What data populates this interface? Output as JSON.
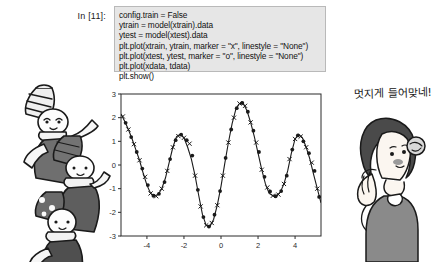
{
  "notebook": {
    "prompt_label": "In [11]:",
    "code_lines": [
      "config.train = False",
      "ytrain = model(xtrain).data",
      "ytest = model(xtest).data",
      "plt.plot(xtrain, ytrain, marker = \"x\", linestyle = \"None\")",
      "plt.plot(xtest, ytest, marker = \"o\", linestyle = \"None\")",
      "plt.plot(xdata, tdata)",
      "plt.show()"
    ],
    "cell_background": "#e6e6e6",
    "cell_border": "#b9b9b9"
  },
  "annotation": {
    "korean_text": "멋지게 들어맞네!"
  },
  "illustrations": {
    "left_group_label": "three-cartoon-kids-with-striped-hats-and-scarves",
    "right_label": "woman-with-short-hair-hands-raised"
  },
  "chart_data": {
    "type": "line",
    "title": "",
    "xlabel": "",
    "ylabel": "",
    "xlim": [
      -5.4,
      5.4
    ],
    "ylim": [
      -3,
      3
    ],
    "xticks": [
      -4,
      -2,
      0,
      2,
      4
    ],
    "yticks": [
      3,
      2,
      1,
      0,
      -1,
      -2,
      -3
    ],
    "grid": false,
    "legend": "none",
    "series": [
      {
        "name": "tdata (true curve)",
        "marker": "none",
        "linestyle": "-",
        "color": "#1a1a1a",
        "x": [
          -5.4,
          -5.2,
          -5.0,
          -4.8,
          -4.6,
          -4.4,
          -4.2,
          -4.0,
          -3.8,
          -3.6,
          -3.4,
          -3.2,
          -3.0,
          -2.8,
          -2.6,
          -2.4,
          -2.2,
          -2.0,
          -1.8,
          -1.6,
          -1.4,
          -1.2,
          -1.0,
          -0.8,
          -0.6,
          -0.4,
          -0.2,
          0.0,
          0.2,
          0.4,
          0.6,
          0.8,
          1.0,
          1.2,
          1.4,
          1.6,
          1.8,
          2.0,
          2.2,
          2.4,
          2.6,
          2.8,
          3.0,
          3.2,
          3.4,
          3.6,
          3.8,
          4.0,
          4.2,
          4.4,
          4.6,
          4.8,
          5.0,
          5.2,
          5.4
        ],
        "y": [
          2.15,
          1.85,
          1.5,
          1.1,
          0.65,
          0.2,
          -0.35,
          -0.85,
          -1.2,
          -1.3,
          -1.25,
          -1.0,
          -0.55,
          0.1,
          0.75,
          1.2,
          1.3,
          1.15,
          0.75,
          0.25,
          -0.45,
          -1.3,
          -2.1,
          -2.55,
          -2.6,
          -2.3,
          -1.7,
          -0.9,
          0.05,
          0.95,
          1.75,
          2.35,
          2.6,
          2.6,
          2.3,
          1.8,
          1.2,
          0.5,
          -0.2,
          -0.8,
          -1.2,
          -1.3,
          -1.3,
          -1.15,
          -0.8,
          -0.25,
          0.5,
          1.1,
          1.3,
          1.15,
          0.75,
          0.25,
          -0.4,
          -1.0,
          -1.6
        ]
      },
      {
        "name": "ytrain (marker x)",
        "marker": "x",
        "linestyle": "None",
        "color": "#1a1a1a",
        "x": [
          -5.3,
          -5.0,
          -4.7,
          -4.4,
          -4.1,
          -3.8,
          -3.5,
          -3.2,
          -2.9,
          -2.6,
          -2.3,
          -2.0,
          -1.7,
          -1.4,
          -1.1,
          -0.8,
          -0.5,
          -0.2,
          0.1,
          0.4,
          0.7,
          1.0,
          1.3,
          1.6,
          1.9,
          2.2,
          2.5,
          2.8,
          3.1,
          3.4,
          3.7,
          4.0,
          4.3,
          4.6,
          4.9,
          5.2
        ],
        "y": [
          2.05,
          1.5,
          0.88,
          0.2,
          -0.5,
          -1.2,
          -1.32,
          -1.0,
          -0.25,
          0.75,
          1.22,
          1.15,
          0.9,
          -0.45,
          -1.75,
          -2.55,
          -2.45,
          -1.7,
          -0.45,
          0.95,
          2.0,
          2.6,
          2.5,
          1.8,
          0.95,
          -0.2,
          -0.95,
          -1.3,
          -1.25,
          -0.8,
          0.25,
          1.1,
          1.2,
          0.75,
          0.1,
          -1.0
        ]
      },
      {
        "name": "ytest (marker o)",
        "marker": "o",
        "linestyle": "None",
        "color": "#1a1a1a",
        "x": [
          -5.15,
          -4.85,
          -4.55,
          -4.25,
          -3.95,
          -3.65,
          -3.35,
          -3.05,
          -2.75,
          -2.45,
          -2.15,
          -1.85,
          -1.55,
          -1.25,
          -0.95,
          -0.65,
          -0.35,
          -0.05,
          0.25,
          0.55,
          0.85,
          1.15,
          1.45,
          1.75,
          2.05,
          2.35,
          2.65,
          2.95,
          3.25,
          3.55,
          3.85,
          4.15,
          4.45,
          4.75,
          5.05,
          5.3
        ],
        "y": [
          1.78,
          1.18,
          0.55,
          -0.15,
          -0.85,
          -1.3,
          -1.22,
          -0.72,
          0.25,
          1.05,
          1.28,
          1.05,
          0.4,
          -1.05,
          -2.2,
          -2.6,
          -2.1,
          -1.1,
          0.3,
          1.5,
          2.4,
          2.62,
          2.25,
          1.45,
          0.55,
          -0.5,
          -1.12,
          -1.32,
          -1.1,
          -0.45,
          0.65,
          1.25,
          1.0,
          0.5,
          -0.25,
          -1.35
        ]
      }
    ]
  }
}
